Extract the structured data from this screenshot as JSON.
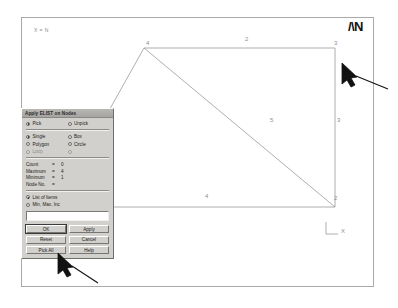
{
  "canvas": {
    "info_text": "X = N",
    "logo_text": "/\\N",
    "triad_label_x": "X",
    "triad_label_y": "Y"
  },
  "mesh": {
    "node_labels": [
      {
        "id": "1",
        "x": 36,
        "y": 182
      },
      {
        "id": "2",
        "x": 312,
        "y": 182
      },
      {
        "id": "3",
        "x": 312,
        "y": 27
      },
      {
        "id": "4",
        "x": 124,
        "y": 27
      }
    ],
    "element_labels": [
      {
        "id": "1",
        "x": 62,
        "y": 105
      },
      {
        "id": "2",
        "x": 223,
        "y": 23
      },
      {
        "id": "3",
        "x": 315,
        "y": 104
      },
      {
        "id": "4",
        "x": 183,
        "y": 180
      },
      {
        "id": "5",
        "x": 248,
        "y": 104
      }
    ],
    "edges": [
      {
        "name": "elem-1",
        "x1": 33,
        "y1": 189,
        "x2": 122,
        "y2": 30
      },
      {
        "name": "elem-2",
        "x1": 122,
        "y1": 30,
        "x2": 313,
        "y2": 30
      },
      {
        "name": "elem-3",
        "x1": 313,
        "y1": 30,
        "x2": 313,
        "y2": 189
      },
      {
        "name": "elem-4",
        "x1": 33,
        "y1": 189,
        "x2": 313,
        "y2": 189
      },
      {
        "name": "elem-5",
        "x1": 122,
        "y1": 30,
        "x2": 313,
        "y2": 189
      }
    ]
  },
  "dialog": {
    "title": "Apply ELIST on Nodes",
    "mode_row": [
      {
        "label": "Pick",
        "selected": true
      },
      {
        "label": "Unpick",
        "selected": false
      }
    ],
    "shape_rows": [
      [
        {
          "label": "Single",
          "selected": true,
          "disabled": false
        },
        {
          "label": "Box",
          "selected": false,
          "disabled": false
        }
      ],
      [
        {
          "label": "Polygon",
          "selected": false,
          "disabled": false
        },
        {
          "label": "Circle",
          "selected": false,
          "disabled": false
        }
      ],
      [
        {
          "label": "Loop",
          "selected": false,
          "disabled": true
        },
        {
          "label": "",
          "selected": false,
          "disabled": true
        }
      ]
    ],
    "stats": [
      {
        "label": "Count",
        "eq": "=",
        "value": "0"
      },
      {
        "label": "Maximum",
        "eq": "=",
        "value": "4"
      },
      {
        "label": "Minimum",
        "eq": "=",
        "value": "1"
      },
      {
        "label": "Node No.",
        "eq": "=",
        "value": ""
      }
    ],
    "list_rows": [
      {
        "label": "List of Items",
        "selected": true
      },
      {
        "label": "Min, Max, Inc",
        "selected": false
      }
    ],
    "entry_value": "",
    "buttons": [
      {
        "label": "OK",
        "default": true
      },
      {
        "label": "Apply",
        "default": false
      },
      {
        "label": "Reset",
        "default": false
      },
      {
        "label": "Cancel",
        "default": false
      },
      {
        "label": "Pick All",
        "default": false
      },
      {
        "label": "Help",
        "default": false
      }
    ]
  }
}
